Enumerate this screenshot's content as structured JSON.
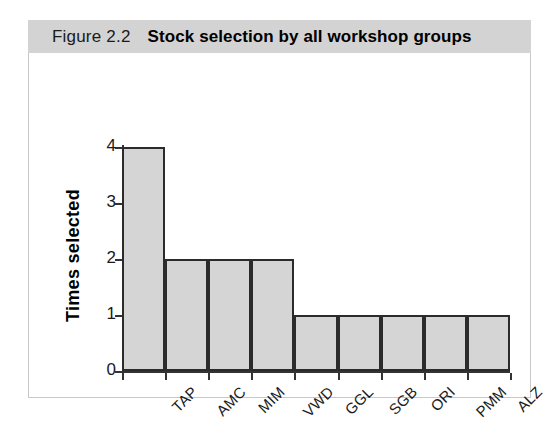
{
  "figure": {
    "number": "Figure 2.2",
    "caption": "Stock selection by all workshop groups"
  },
  "colors": {
    "title_bar": "#d3d3d3",
    "bar_fill": "#d5d5d5",
    "bar_border": "#2b2b2b",
    "axis": "#333333",
    "panel_border": "#c8c8c8",
    "page_background": "#ffffff"
  },
  "chart_data": {
    "type": "bar",
    "title": "Figure 2.2  Stock selection by all workshop groups",
    "subtitle": "",
    "xlabel": "",
    "ylabel": "Times selected",
    "categories": [
      "TAP",
      "AMC",
      "MIM",
      "VWD",
      "GGL",
      "SGB",
      "ORI",
      "PMM",
      "ALZ"
    ],
    "values": [
      4,
      2,
      2,
      2,
      1,
      1,
      1,
      1,
      1
    ],
    "ylim": [
      0,
      4
    ],
    "yticks": [
      0,
      1,
      2,
      3,
      4
    ],
    "ytick_labels": [
      "0",
      "1",
      "2",
      "3",
      "4"
    ],
    "grid": false,
    "legend": false,
    "bar_gap": 0,
    "x_tick_label_rotation": -45
  }
}
